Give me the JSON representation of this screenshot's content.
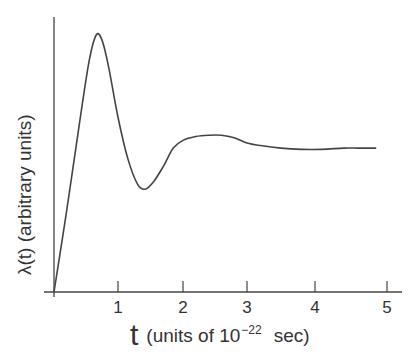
{
  "chart_data": {
    "type": "line",
    "title": "",
    "xlabel": "t  (units of 10^-22 sec)",
    "ylabel": "λ(t)  (arbitrary units)",
    "xlabel_parts": {
      "symbol": "t",
      "prefix": "(units of 10",
      "exponent": "−22",
      "suffix": "sec)"
    },
    "xticks": [
      "1",
      "2",
      "3",
      "4",
      "5"
    ],
    "xlim": [
      0,
      5.2
    ],
    "ylim": [
      0,
      1.0
    ],
    "yticks": [],
    "grid": false,
    "legend": null,
    "series": [
      {
        "name": "λ(t)",
        "x": [
          0.0,
          0.2,
          0.4,
          0.55,
          0.66,
          0.75,
          0.85,
          1.0,
          1.15,
          1.3,
          1.42,
          1.55,
          1.7,
          1.85,
          2.0,
          2.2,
          2.4,
          2.6,
          2.8,
          3.0,
          3.2,
          3.5,
          3.8,
          4.1,
          4.4,
          4.6,
          4.85
        ],
        "y": [
          0.0,
          0.32,
          0.66,
          0.9,
          1.0,
          0.98,
          0.88,
          0.68,
          0.52,
          0.42,
          0.4,
          0.43,
          0.49,
          0.56,
          0.59,
          0.605,
          0.61,
          0.61,
          0.6,
          0.58,
          0.57,
          0.56,
          0.555,
          0.555,
          0.56,
          0.56,
          0.56
        ]
      }
    ]
  },
  "axes": {
    "y_label": "λ(t)  (arbitrary units)",
    "x_symbol": "t",
    "x_units_prefix": "(units of 10",
    "x_units_exponent": "−22",
    "x_units_suffix": "sec)"
  },
  "ticks": [
    "1",
    "2",
    "3",
    "4",
    "5"
  ]
}
